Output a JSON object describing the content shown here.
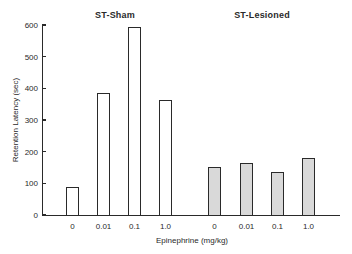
{
  "chart_data": {
    "type": "bar",
    "title": "",
    "panels": [
      "ST-Sham",
      "ST-Lesioned"
    ],
    "categories": [
      "0",
      "0.01",
      "0.1",
      "1.0"
    ],
    "series": [
      {
        "name": "ST-Sham",
        "values": [
          88,
          385,
          595,
          362
        ],
        "fill": "#ffffff"
      },
      {
        "name": "ST-Lesioned",
        "values": [
          152,
          163,
          137,
          181
        ],
        "fill": "#d9d9d9"
      }
    ],
    "xlabel": "Epinephrine (mg/kg)",
    "ylabel": "Retention Latency (sec)",
    "ylim": [
      0,
      600
    ],
    "yticks": [
      0,
      100,
      200,
      300,
      400,
      500,
      600
    ],
    "grid": false,
    "legend": "panel titles above each group"
  },
  "colors": {
    "axis": "#2a2a2a",
    "sham_fill": "#ffffff",
    "lesioned_fill": "#d9d9d9"
  }
}
